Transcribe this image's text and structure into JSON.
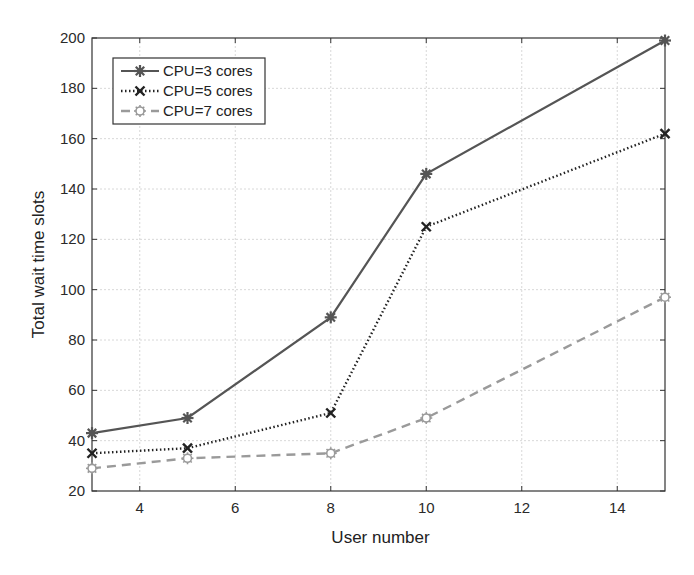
{
  "chart_data": {
    "type": "line",
    "title": "",
    "xlabel": "User number",
    "ylabel": "Total wait time slots",
    "xlim": [
      3,
      15
    ],
    "ylim": [
      20,
      200
    ],
    "xticks": [
      4,
      6,
      8,
      10,
      12,
      14
    ],
    "yticks": [
      20,
      40,
      60,
      80,
      100,
      120,
      140,
      160,
      180,
      200
    ],
    "grid": true,
    "legend_position": "upper left",
    "x": [
      3,
      5,
      8,
      10,
      15
    ],
    "series": [
      {
        "name": "CPU=3 cores",
        "values": [
          43,
          49,
          89,
          146,
          199
        ],
        "color": "#555555",
        "line_style": "solid",
        "marker": "asterisk"
      },
      {
        "name": "CPU=5 cores",
        "values": [
          35,
          37,
          51,
          125,
          162
        ],
        "color": "#222222",
        "line_style": "dotted",
        "marker": "x"
      },
      {
        "name": "CPU=7 cores",
        "values": [
          29,
          33,
          35,
          49,
          97
        ],
        "color": "#9a9a9a",
        "line_style": "dashed",
        "marker": "circle"
      }
    ]
  }
}
